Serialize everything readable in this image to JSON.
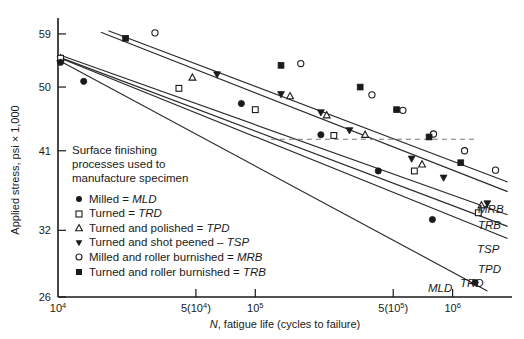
{
  "chart_data": {
    "type": "scatter",
    "title": "",
    "xlabel": "N, fatigue life (cycles to failure)",
    "ylabel": "Applied stress, psi × 1,000",
    "xscale": "log",
    "yscale": "log",
    "xlim": [
      10000,
      2000000
    ],
    "ylim": [
      26,
      62
    ],
    "grid": false,
    "legend_position": "inside-lower-left",
    "xticks": [
      {
        "value": 10000,
        "label": "10",
        "sup": "4"
      },
      {
        "value": 50000,
        "label": "5(10",
        "sup": "4",
        "label_end": ")"
      },
      {
        "value": 100000,
        "label": "10",
        "sup": "5"
      },
      {
        "value": 500000,
        "label": "5(10",
        "sup": "5",
        "label_end": ")"
      },
      {
        "value": 1000000,
        "label": "10",
        "sup": "6"
      }
    ],
    "yticks": [
      {
        "value": 59,
        "label": "59"
      },
      {
        "value": 50,
        "label": "50"
      },
      {
        "value": 41,
        "label": "41"
      },
      {
        "value": 32,
        "label": "32"
      },
      {
        "value": 26,
        "label": "26"
      }
    ],
    "reference_line": {
      "type": "horizontal",
      "y": 42.5,
      "x_from": 120000,
      "x_to": 1300000,
      "style": "dashed"
    },
    "series": [
      {
        "name": "Milled and roller burnished = MRB",
        "code": "MRB",
        "marker": "circle-open",
        "end_label": "MRB",
        "fit": {
          "x1": 18000,
          "y1": 59.6,
          "x2": 1900000,
          "y2": 37.2
        },
        "points": [
          {
            "x": 31000,
            "y": 59.2
          },
          {
            "x": 170000,
            "y": 53.8
          },
          {
            "x": 390000,
            "y": 48.8
          },
          {
            "x": 560000,
            "y": 46.5
          },
          {
            "x": 800000,
            "y": 43.2
          },
          {
            "x": 1150000,
            "y": 41.0
          },
          {
            "x": 1650000,
            "y": 38.6
          }
        ]
      },
      {
        "name": "Turned and roller burnished = TRB",
        "code": "TRB",
        "marker": "square-filled",
        "end_label": "TRB",
        "fit": {
          "x1": 16500,
          "y1": 59.3,
          "x2": 1900000,
          "y2": 36.1
        },
        "points": [
          {
            "x": 22000,
            "y": 58.2
          },
          {
            "x": 135000,
            "y": 53.5
          },
          {
            "x": 340000,
            "y": 50.0
          },
          {
            "x": 520000,
            "y": 46.6
          },
          {
            "x": 760000,
            "y": 42.8
          },
          {
            "x": 1100000,
            "y": 39.5
          }
        ]
      },
      {
        "name": "Turned and shot peened – TSP",
        "code": "TSP",
        "marker": "triangle-down-filled",
        "end_label": "TSP",
        "fit": {
          "x1": 10300,
          "y1": 55.2,
          "x2": 1900000,
          "y2": 33.6
        },
        "points": [
          {
            "x": 10300,
            "y": 54.6
          },
          {
            "x": 64000,
            "y": 52.0
          },
          {
            "x": 135000,
            "y": 48.9
          },
          {
            "x": 215000,
            "y": 46.2
          },
          {
            "x": 300000,
            "y": 43.7
          },
          {
            "x": 620000,
            "y": 40.0
          },
          {
            "x": 900000,
            "y": 37.7
          },
          {
            "x": 1500000,
            "y": 34.8
          }
        ]
      },
      {
        "name": "Turned and polished = TPD",
        "code": "TPD",
        "marker": "triangle-up-open",
        "end_label": "TPD",
        "fit": {
          "x1": 10300,
          "y1": 54.8,
          "x2": 1900000,
          "y2": 32.4
        },
        "points": [
          {
            "x": 10300,
            "y": 54.7
          },
          {
            "x": 48000,
            "y": 51.5
          },
          {
            "x": 150000,
            "y": 48.6
          },
          {
            "x": 230000,
            "y": 45.8
          },
          {
            "x": 360000,
            "y": 43.1
          },
          {
            "x": 700000,
            "y": 39.3
          },
          {
            "x": 1400000,
            "y": 34.6
          }
        ]
      },
      {
        "name": "Turned = TRD",
        "code": "TRD",
        "marker": "square-open",
        "end_label": "TRD",
        "fit": {
          "x1": 10300,
          "y1": 54.7,
          "x2": 1900000,
          "y2": 31.2
        },
        "points": [
          {
            "x": 10300,
            "y": 54.7
          },
          {
            "x": 41000,
            "y": 49.8
          },
          {
            "x": 100000,
            "y": 46.6
          },
          {
            "x": 250000,
            "y": 43.0
          },
          {
            "x": 640000,
            "y": 38.5
          },
          {
            "x": 1350000,
            "y": 33.8
          }
        ]
      },
      {
        "name": "Milled = MLD",
        "code": "MLD",
        "marker": "circle-filled",
        "end_label": "MLD",
        "fit": {
          "x1": 10300,
          "y1": 54.2,
          "x2": 1500000,
          "y2": 26.5
        },
        "points": [
          {
            "x": 10300,
            "y": 54.0
          },
          {
            "x": 13500,
            "y": 50.9
          },
          {
            "x": 85000,
            "y": 47.5
          },
          {
            "x": 215000,
            "y": 43.1
          },
          {
            "x": 420000,
            "y": 38.5
          },
          {
            "x": 790000,
            "y": 33.1
          },
          {
            "x": 1300000,
            "y": 27.2
          }
        ]
      }
    ]
  },
  "axes": {
    "x_title_italic": "N",
    "x_title_rest": ", fatigue life (cycles to failure)",
    "y_title": "Applied stress, psi × 1,000"
  },
  "legend": {
    "title_line1": "Surface finishing",
    "title_line2": "processes used to",
    "title_line3": "manufacture specimen",
    "items": [
      {
        "marker": "circle-filled",
        "text_plain": "Milled = ",
        "code": "MLD"
      },
      {
        "marker": "square-open",
        "text_plain": "Turned = ",
        "code": "TRD"
      },
      {
        "marker": "triangle-up-open",
        "text_plain": "Turned and polished = ",
        "code": "TPD"
      },
      {
        "marker": "triangle-down-filled",
        "text_plain": "Turned and shot peened – ",
        "code": "TSP"
      },
      {
        "marker": "circle-open",
        "text_plain": "Milled and roller burnished = ",
        "code": "MRB"
      },
      {
        "marker": "square-filled",
        "text_plain": "Turned and roller burnished = ",
        "code": "TRB"
      }
    ]
  },
  "colors": {
    "ink": "#1a1a1a",
    "line": "#2a2a2a",
    "reference": "#7a7a7a",
    "background": "#ffffff"
  }
}
